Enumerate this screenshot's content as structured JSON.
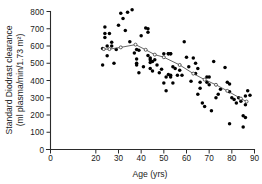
{
  "chart_data": {
    "type": "scatter",
    "title": "",
    "xlabel": "Age (yrs)",
    "ylabel": "Standard Diodrast clearance (ml plasma/min/1.73 m2)",
    "ylabel_line1": "Standard Diodrast clearance",
    "ylabel_line2": "(ml plasma/min/1.73 m²)",
    "xlim": [
      0,
      90
    ],
    "ylim": [
      0,
      800
    ],
    "xticks": [
      0,
      20,
      30,
      40,
      50,
      60,
      70,
      80,
      90
    ],
    "xtick_labels": [
      "0",
      "20",
      "30",
      "40",
      "50",
      "60",
      "70",
      "80",
      "90"
    ],
    "yticks": [
      0,
      100,
      200,
      300,
      400,
      500,
      600,
      700,
      800
    ],
    "ytick_labels": [
      "0",
      "100",
      "200",
      "300",
      "400",
      "500",
      "600",
      "700",
      "800"
    ],
    "grid": false,
    "legend": false,
    "marker": "filled-circle",
    "marker_color": "#000000",
    "series": [
      {
        "name": "Standard Diodrast clearance",
        "x": [
          23,
          23,
          24,
          24,
          24,
          25,
          25,
          26,
          27,
          27,
          28,
          29,
          30,
          31,
          32,
          33,
          34,
          35,
          36,
          37,
          38,
          38,
          38,
          38,
          39,
          39,
          40,
          41,
          42,
          43,
          43,
          43,
          44,
          44,
          44,
          44,
          45,
          45,
          46,
          47,
          48,
          49,
          50,
          50,
          51,
          51,
          52,
          52,
          52,
          53,
          53,
          53,
          53,
          54,
          54,
          55,
          56,
          57,
          58,
          59,
          60,
          61,
          62,
          63,
          64,
          64,
          65,
          65,
          66,
          66,
          67,
          68,
          69,
          69,
          70,
          70,
          71,
          72,
          73,
          74,
          75,
          77,
          78,
          79,
          79,
          79,
          80,
          81,
          82,
          83,
          84,
          85,
          85,
          86,
          86,
          86,
          87,
          88
        ],
        "y": [
          585,
          490,
          710,
          650,
          672,
          600,
          543,
          672,
          622,
          600,
          500,
          580,
          720,
          790,
          760,
          690,
          795,
          625,
          810,
          560,
          580,
          525,
          500,
          490,
          575,
          445,
          660,
          480,
          705,
          700,
          680,
          545,
          530,
          520,
          505,
          470,
          510,
          455,
          520,
          490,
          445,
          465,
          555,
          385,
          420,
          340,
          555,
          555,
          435,
          555,
          555,
          430,
          420,
          480,
          385,
          470,
          430,
          460,
          430,
          625,
          535,
          480,
          395,
          530,
          500,
          440,
          470,
          320,
          390,
          355,
          270,
          250,
          420,
          390,
          420,
          375,
          225,
          510,
          300,
          320,
          350,
          475,
          390,
          150,
          335,
          380,
          300,
          290,
          270,
          300,
          280,
          130,
          195,
          185,
          310,
          260,
          340,
          315
        ]
      }
    ],
    "trend_line": {
      "name": "fitted trend",
      "marker": "open-circle",
      "color": "#4a4a4a",
      "x": [
        23.5,
        26,
        31,
        37.5,
        42,
        46,
        50,
        57,
        63,
        68,
        73,
        78,
        84,
        86.5
      ],
      "y": [
        582,
        582,
        592,
        608,
        578,
        550,
        535,
        490,
        440,
        405,
        375,
        340,
        295,
        278
      ]
    }
  },
  "axes": {
    "x_title": "Age (yrs)",
    "y_title_line1": "Standard Diodrast clearance",
    "y_title_line2": "(ml plasma/min/1.73 m²)"
  }
}
